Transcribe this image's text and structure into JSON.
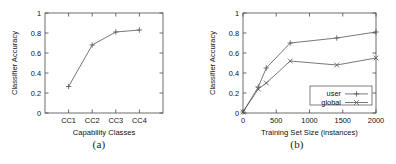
{
  "figure": {
    "panels": [
      {
        "caption": "(a)"
      },
      {
        "caption": "(b)"
      }
    ]
  },
  "chart_data": [
    {
      "type": "line",
      "panel": "(a)",
      "title": "",
      "xlabel": "Capability Classes",
      "ylabel": "Classifier Accuracy",
      "categories": [
        "CC1",
        "CC2",
        "CC3",
        "CC4"
      ],
      "values": [
        0.265,
        0.68,
        0.81,
        0.83
      ],
      "ylim": [
        0,
        1
      ],
      "yticks": [
        "0",
        "0.2",
        "0.4",
        "0.6",
        "0.8",
        "1"
      ],
      "ytick_values": [
        0,
        0.2,
        0.4,
        0.6,
        0.8,
        1
      ],
      "marker": "plus",
      "grid": false,
      "legend": "none",
      "series": [
        {
          "name": "",
          "values": [
            0.265,
            0.68,
            0.81,
            0.83
          ]
        }
      ]
    },
    {
      "type": "line",
      "panel": "(b)",
      "title": "",
      "xlabel": "Training Set Size (instances)",
      "ylabel": "Classifier Accuracy",
      "x": [
        0,
        230,
        350,
        710,
        1410,
        2000
      ],
      "xlim": [
        0,
        2000
      ],
      "ylim": [
        0,
        1
      ],
      "xticks": [
        "0",
        "500",
        "1000",
        "1500",
        "2000"
      ],
      "xtick_values": [
        0,
        500,
        1000,
        1500,
        2000
      ],
      "yticks": [
        "0",
        "0.2",
        "0.4",
        "0.6",
        "0.8",
        "1"
      ],
      "ytick_values": [
        0,
        0.2,
        0.4,
        0.6,
        0.8,
        1
      ],
      "grid": false,
      "legend": "inside-bottom-right",
      "series": [
        {
          "name": "user",
          "marker": "plus",
          "values": [
            0.01,
            0.26,
            0.45,
            0.7,
            0.75,
            0.81
          ]
        },
        {
          "name": "global",
          "marker": "cross",
          "values": [
            0.01,
            0.24,
            0.3,
            0.52,
            0.48,
            0.55
          ]
        }
      ]
    }
  ]
}
